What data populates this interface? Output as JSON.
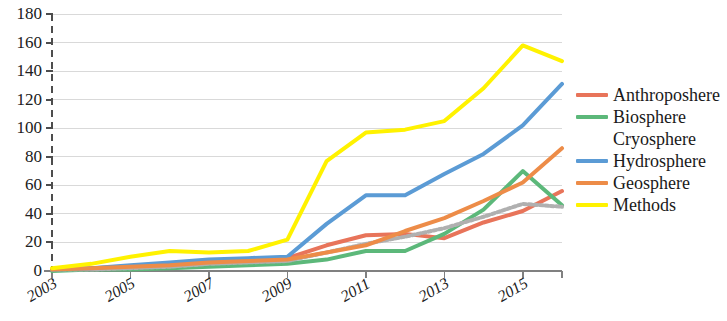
{
  "chart_data": {
    "type": "line",
    "title": "",
    "subtitle": "",
    "xlabel": "",
    "ylabel": "",
    "x": [
      2003,
      2004,
      2005,
      2006,
      2007,
      2008,
      2009,
      2010,
      2011,
      2012,
      2013,
      2014,
      2015,
      2016
    ],
    "xlim": [
      2003,
      2016
    ],
    "ylim": [
      0,
      180
    ],
    "yticks": [
      0,
      20,
      40,
      60,
      80,
      100,
      120,
      140,
      160,
      180
    ],
    "xticks": [
      2003,
      2005,
      2007,
      2009,
      2011,
      2013,
      2015
    ],
    "xtick_labels": [
      "2003",
      "2005",
      "2007",
      "2009",
      "2011",
      "2013",
      "2015"
    ],
    "ytick_labels": [
      "0",
      "20",
      "40",
      "60",
      "80",
      "100",
      "120",
      "140",
      "160",
      "180"
    ],
    "grid": "horizontal",
    "grid_color": "#d9d9d9",
    "legend_position": "right",
    "background": "#ffffff",
    "axis_color": "#808080",
    "series": [
      {
        "name": "Anthroposhere",
        "color": "#e8745a",
        "style": "solid",
        "values": [
          1,
          2,
          3,
          5,
          7,
          8,
          9,
          18,
          25,
          26,
          23,
          34,
          42,
          56
        ]
      },
      {
        "name": "Biosphere",
        "color": "#5cb87a",
        "style": "solid",
        "values": [
          0,
          1,
          1,
          2,
          3,
          4,
          5,
          8,
          14,
          14,
          26,
          43,
          70,
          46
        ]
      },
      {
        "name": "Cryosphere",
        "color": "#b0b0b0",
        "style": "dotted",
        "values": [
          1,
          1,
          2,
          3,
          5,
          6,
          7,
          13,
          19,
          24,
          30,
          38,
          47,
          45
        ]
      },
      {
        "name": "Hydrosphere",
        "color": "#5b9bd5",
        "style": "solid",
        "values": [
          1,
          2,
          4,
          6,
          8,
          9,
          10,
          33,
          53,
          53,
          68,
          82,
          102,
          131
        ]
      },
      {
        "name": "Geosphere",
        "color": "#ed8c48",
        "style": "solid",
        "values": [
          1,
          2,
          3,
          4,
          6,
          7,
          8,
          13,
          18,
          28,
          37,
          49,
          62,
          86
        ]
      },
      {
        "name": "Methods",
        "color": "#fff200",
        "style": "solid",
        "values": [
          2,
          5,
          10,
          14,
          13,
          14,
          22,
          77,
          97,
          99,
          105,
          128,
          158,
          147
        ]
      }
    ]
  },
  "legend": {
    "items": [
      {
        "label": "Anthroposhere",
        "color": "#e8745a",
        "style": "solid"
      },
      {
        "label": "Biosphere",
        "color": "#5cb87a",
        "style": "solid"
      },
      {
        "label": "Cryosphere",
        "color": "#b0b0b0",
        "style": "dotted"
      },
      {
        "label": "Hydrosphere",
        "color": "#5b9bd5",
        "style": "solid"
      },
      {
        "label": "Geosphere",
        "color": "#ed8c48",
        "style": "solid"
      },
      {
        "label": "Methods",
        "color": "#fff200",
        "style": "solid"
      }
    ]
  }
}
